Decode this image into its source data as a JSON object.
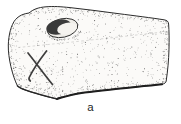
{
  "figure": {
    "panel_label": "a",
    "style": "stipple-ink-line-drawing",
    "features": [
      "drilled-hole",
      "incised-x-mark",
      "shadowed-bottom-edge"
    ],
    "colors": {
      "ink": "#2b2b2b",
      "paper": "#ffffff",
      "object_fill": "#fbfaf8",
      "hole_shadow": "#3a3a3a",
      "hole_opening": "#f5f3ef",
      "stipple": "#3c3c3c",
      "label_text": "#1f1f1f"
    }
  }
}
